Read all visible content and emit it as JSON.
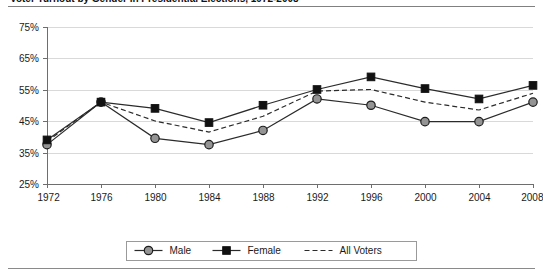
{
  "figure": {
    "title_partial": "Voter Turnout by Gender in Presidential Elections, 1972-2008",
    "title_visible_note": "cropped at top edge"
  },
  "chart_data": {
    "type": "line",
    "title": "",
    "xlabel": "",
    "ylabel": "",
    "categories": [
      "1972",
      "1976",
      "1980",
      "1984",
      "1988",
      "1992",
      "1996",
      "2000",
      "2004",
      "2008"
    ],
    "ylim": [
      25,
      75
    ],
    "ytick_labels": [
      "25%",
      "35%",
      "45%",
      "55%",
      "65%",
      "75%"
    ],
    "yticks": [
      25,
      35,
      45,
      55,
      65,
      75
    ],
    "grid": true,
    "legend_position": "bottom",
    "series": [
      {
        "name": "Male",
        "marker": "circle",
        "line_style": "solid",
        "color": "#949494",
        "values": [
          37.5,
          51.0,
          39.5,
          37.5,
          42.0,
          52.0,
          50.0,
          44.8,
          44.8,
          51.0
        ]
      },
      {
        "name": "Female",
        "marker": "square",
        "line_style": "solid",
        "color": "#111111",
        "values": [
          39.0,
          51.0,
          49.0,
          44.5,
          50.0,
          55.0,
          59.0,
          55.3,
          52.0,
          56.3
        ]
      },
      {
        "name": "All Voters",
        "marker": "none",
        "line_style": "dashed",
        "color": "#2b2b2b",
        "values": [
          38.5,
          51.0,
          45.0,
          41.5,
          46.5,
          54.5,
          55.0,
          51.0,
          48.5,
          53.8
        ]
      }
    ]
  }
}
